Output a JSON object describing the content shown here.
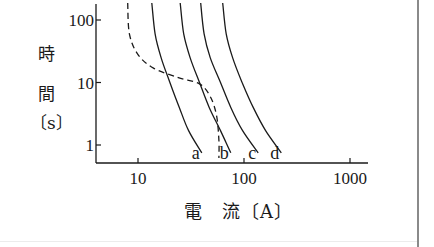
{
  "chart_data": {
    "type": "line",
    "title": "",
    "xlabel": "電 流〔A〕",
    "ylabel": "時間〔s〕",
    "xscale": "log",
    "yscale": "log",
    "xlim": [
      4,
      1500
    ],
    "ylim": [
      0.5,
      200
    ],
    "x_ticks": [
      "10",
      "100",
      "1000"
    ],
    "y_ticks": [
      "1",
      "10",
      "100"
    ],
    "grid": false,
    "legend": "inline labels at curve ends",
    "series": [
      {
        "name": "a",
        "style": "solid",
        "points": [
          [
            13.5,
            200
          ],
          [
            14.5,
            60
          ],
          [
            16.5,
            25
          ],
          [
            20,
            10
          ],
          [
            24.5,
            4
          ],
          [
            30,
            1.7
          ],
          [
            40,
            0.75
          ]
        ]
      },
      {
        "name": "b",
        "style": "solid",
        "points": [
          [
            25,
            200
          ],
          [
            27,
            60
          ],
          [
            31,
            25
          ],
          [
            38,
            10
          ],
          [
            47,
            4
          ],
          [
            60,
            1.7
          ],
          [
            75,
            0.75
          ]
        ]
      },
      {
        "name": "c",
        "style": "solid",
        "points": [
          [
            39,
            200
          ],
          [
            42,
            60
          ],
          [
            48,
            25
          ],
          [
            60,
            10
          ],
          [
            75,
            4
          ],
          [
            97,
            1.7
          ],
          [
            136,
            0.75
          ]
        ]
      },
      {
        "name": "d",
        "style": "solid",
        "points": [
          [
            63,
            200
          ],
          [
            68,
            60
          ],
          [
            78,
            25
          ],
          [
            96,
            10
          ],
          [
            122,
            4
          ],
          [
            160,
            1.7
          ],
          [
            225,
            0.75
          ]
        ]
      },
      {
        "name": "dashed",
        "style": "dashed",
        "points": [
          [
            8,
            200
          ],
          [
            8.3,
            60
          ],
          [
            10,
            28
          ],
          [
            14,
            17
          ],
          [
            24,
            12
          ],
          [
            38,
            9.5
          ],
          [
            48,
            6
          ],
          [
            55,
            3
          ],
          [
            58,
            1.2
          ],
          [
            58,
            0.6
          ]
        ]
      }
    ]
  },
  "labels": {
    "y_title_chars": [
      "時",
      "間",
      "〔s〕"
    ],
    "x_title": "電　流〔A〕"
  }
}
